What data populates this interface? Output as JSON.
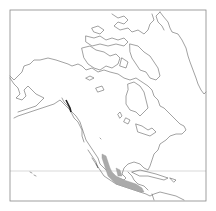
{
  "map": {
    "type": "species-range-map",
    "region": "North America",
    "projection": "polar-azimuthal",
    "frame": {
      "x": 10,
      "y": 10,
      "width": 196,
      "height": 191,
      "stroke": "#888888"
    },
    "reference_line": {
      "label": "Tropic of Cancer",
      "y": 171,
      "color": "#c8c8c8"
    },
    "range": {
      "description": "Shaded distribution along western Mexico and Central America",
      "fill": "#aaaaaa"
    },
    "colors": {
      "background": "#ffffff",
      "coastline": "#555555"
    }
  }
}
